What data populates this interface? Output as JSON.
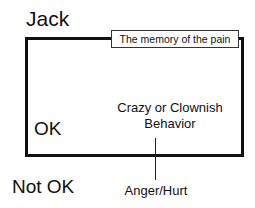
{
  "diagram": {
    "title": "Jack",
    "top_label": "The memory of the pain",
    "inside_left": "OK",
    "inside_center_line1": "Crazy or Clownish",
    "inside_center_line2": "Behavior",
    "below_left": "Not OK",
    "below_center": "Anger/Hurt"
  }
}
